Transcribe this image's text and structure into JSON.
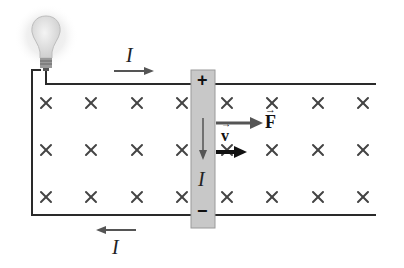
{
  "diagram": {
    "labels": {
      "current_top": "I",
      "current_rod": "I",
      "current_bottom": "I",
      "rod_positive": "+",
      "rod_negative": "−",
      "force": "F",
      "velocity": "v"
    },
    "field": {
      "symbol": "×",
      "direction": "into page",
      "rows": [
        103,
        150,
        197
      ],
      "columns": [
        46,
        91,
        137,
        182,
        227,
        272,
        318,
        363
      ]
    },
    "colors": {
      "wire": "#2a2a2a",
      "rod": "#c8c8c8",
      "rod_border": "#9a9a9a",
      "arrow_current": "#555555",
      "arrow_force": "#555555",
      "arrow_velocity": "#111111",
      "field_mark": "#444444"
    }
  }
}
